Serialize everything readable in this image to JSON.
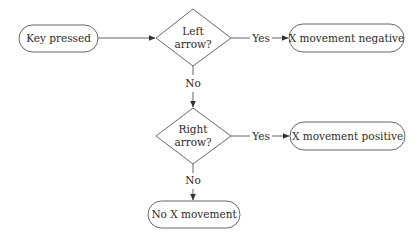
{
  "diagram": {
    "type": "flowchart",
    "nodes": {
      "start": {
        "label": "Key pressed",
        "shape": "terminal"
      },
      "left_decision": {
        "line1": "Left",
        "line2": "arrow?",
        "shape": "decision"
      },
      "left_result": {
        "label": "X movement negative",
        "shape": "terminal"
      },
      "right_decision": {
        "line1": "Right",
        "line2": "arrow?",
        "shape": "decision"
      },
      "right_result": {
        "label": "X movement positive",
        "shape": "terminal"
      },
      "none_result": {
        "label": "No X movement",
        "shape": "terminal"
      }
    },
    "edges": {
      "start_to_left": {
        "label": ""
      },
      "left_yes": {
        "label": "Yes"
      },
      "left_no": {
        "label": "No"
      },
      "right_yes": {
        "label": "Yes"
      },
      "right_no": {
        "label": "No"
      }
    }
  }
}
